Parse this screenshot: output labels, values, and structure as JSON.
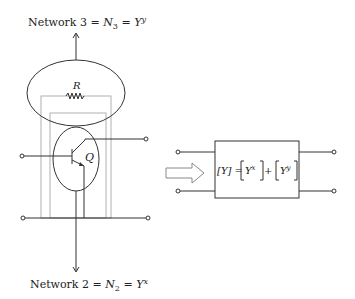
{
  "top_label": {
    "prefix": "Network 3 = ",
    "n_symbol": "N",
    "n_sub": "3",
    "eq": " = ",
    "y_symbol": "Y",
    "y_sup": "y"
  },
  "bottom_label": {
    "prefix": "Network 2 = ",
    "n_symbol": "N",
    "n_sub": "2",
    "eq": " = ",
    "y_symbol": "Y",
    "y_sup": "x"
  },
  "resistor_label": "R",
  "transistor_label": "Q",
  "equivalent": {
    "lhs": "[Y]",
    "eq": " = ",
    "term1_symbol": "Y",
    "term1_sup": "x",
    "plus": " + ",
    "term2_symbol": "Y",
    "term2_sup": "y"
  }
}
